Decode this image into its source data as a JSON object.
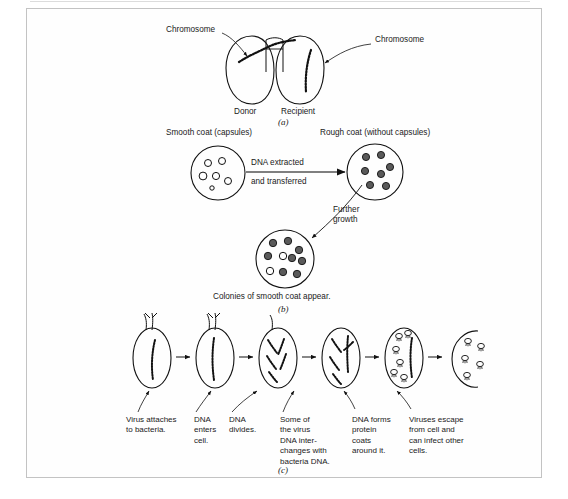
{
  "figure": {
    "background_color": "#ffffff",
    "border_color": "#c3c3c3",
    "ink_color": "#111111",
    "fill_dark": "#5a5a5a",
    "fill_light": "#ffffff"
  },
  "panel_a": {
    "letter": "(a)",
    "label_left": "Chromosome",
    "label_right": "Chromosome",
    "cell_left": "Donor",
    "cell_right": "Recipient"
  },
  "panel_b": {
    "letter": "(b)",
    "title_left": "Smooth coat (capsules)",
    "title_right": "Rough coat (without capsules)",
    "arrow_label_line1": "DNA extracted",
    "arrow_label_line2": "and transferred",
    "growth_label_line1": "Further",
    "growth_label_line2": "growth",
    "bottom_label": "Colonies of smooth coat appear.",
    "smooth_dot_count": 6,
    "rough_dot_count": 7,
    "colony_dark_count": 8,
    "colony_light_count": 2
  },
  "panel_c": {
    "letter": "(c)",
    "steps": [
      "Virus attaches to bacteria.",
      "DNA enters cell.",
      "DNA divides.",
      "Some of the virus DNA inter- changes with bacteria DNA.",
      "DNA forms protein coats around it.",
      "Viruses escape from cell and can infect other cells."
    ],
    "step_lines": [
      [
        "Virus attaches",
        "to bacteria."
      ],
      [
        "DNA",
        "enters",
        "cell."
      ],
      [
        "DNA",
        "divides."
      ],
      [
        "Some of",
        "the virus",
        "DNA inter-",
        "changes with",
        "bacteria DNA."
      ],
      [
        "DNA forms",
        "protein",
        "coats",
        "around it."
      ],
      [
        "Viruses escape",
        "from cell and",
        "can infect other",
        "cells."
      ]
    ],
    "cell_count": 6,
    "arrow_count": 5
  }
}
